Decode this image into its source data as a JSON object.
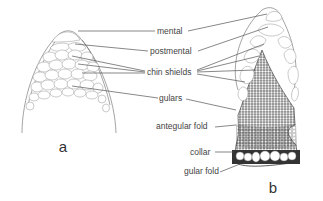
{
  "figure": {
    "panels": [
      {
        "id": "a",
        "label": "a",
        "description": "Ventral view of lizard chin with large scales"
      },
      {
        "id": "b",
        "label": "b",
        "description": "Ventral view of lizard chin and throat with dense granular gulars"
      }
    ],
    "labels": [
      {
        "key": "mental",
        "text": "mental"
      },
      {
        "key": "postmental",
        "text": "postmental"
      },
      {
        "key": "chin_shields",
        "text": "chin shields"
      },
      {
        "key": "gulars",
        "text": "gulars"
      },
      {
        "key": "antegular_fold",
        "text": "antegular fold"
      },
      {
        "key": "collar",
        "text": "collar"
      },
      {
        "key": "gular_fold",
        "text": "gular fold"
      }
    ],
    "colors": {
      "line": "#555555",
      "text": "#444444",
      "background": "#ffffff"
    }
  }
}
